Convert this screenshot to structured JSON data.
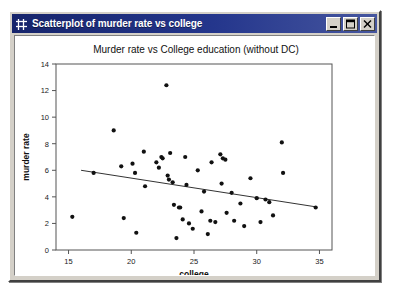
{
  "window": {
    "title": "Scatterplot of murder rate vs college",
    "icon": "plot-grid-icon",
    "buttons": {
      "minimize": "minimize-icon",
      "maximize": "maximize-icon",
      "close": "close-icon"
    },
    "colors": {
      "titlebar_start": "#16246b",
      "titlebar_end": "#46569f",
      "chrome": "#d4d0c8",
      "client_bg": "#ffffff"
    }
  },
  "chart_data": {
    "type": "scatter",
    "title": "Murder rate vs College education (without DC)",
    "xlabel": "college",
    "ylabel": "murder rate",
    "xlim": [
      14.0,
      36.0
    ],
    "ylim": [
      0,
      14
    ],
    "xticks": [
      15,
      20,
      25,
      30,
      35
    ],
    "yticks": [
      0,
      2,
      4,
      6,
      8,
      10,
      12,
      14
    ],
    "grid": false,
    "legend": false,
    "marker_color": "#111111",
    "line_color": "#333333",
    "series": [
      {
        "name": "states",
        "points": [
          [
            15.3,
            2.5
          ],
          [
            17.0,
            5.8
          ],
          [
            18.6,
            9.0
          ],
          [
            19.2,
            6.3
          ],
          [
            19.4,
            2.4
          ],
          [
            20.1,
            6.5
          ],
          [
            20.3,
            5.8
          ],
          [
            20.4,
            1.3
          ],
          [
            21.0,
            7.4
          ],
          [
            21.1,
            4.8
          ],
          [
            22.0,
            6.6
          ],
          [
            22.2,
            6.2
          ],
          [
            22.4,
            7.0
          ],
          [
            22.5,
            6.9
          ],
          [
            22.8,
            12.4
          ],
          [
            22.9,
            5.6
          ],
          [
            23.0,
            5.3
          ],
          [
            23.1,
            7.3
          ],
          [
            23.3,
            5.1
          ],
          [
            23.4,
            3.4
          ],
          [
            23.6,
            0.9
          ],
          [
            23.8,
            3.2
          ],
          [
            23.9,
            3.2
          ],
          [
            24.1,
            2.3
          ],
          [
            24.3,
            7.0
          ],
          [
            24.4,
            4.9
          ],
          [
            24.6,
            2.0
          ],
          [
            24.9,
            1.6
          ],
          [
            25.3,
            6.0
          ],
          [
            25.6,
            2.9
          ],
          [
            25.8,
            4.4
          ],
          [
            26.1,
            1.2
          ],
          [
            26.3,
            2.2
          ],
          [
            26.4,
            6.6
          ],
          [
            26.7,
            2.1
          ],
          [
            27.1,
            7.2
          ],
          [
            27.2,
            5.0
          ],
          [
            27.3,
            6.9
          ],
          [
            27.5,
            6.8
          ],
          [
            27.6,
            2.8
          ],
          [
            28.0,
            4.3
          ],
          [
            28.2,
            2.2
          ],
          [
            28.7,
            3.5
          ],
          [
            29.0,
            1.8
          ],
          [
            29.5,
            5.4
          ],
          [
            30.0,
            3.9
          ],
          [
            30.3,
            2.1
          ],
          [
            30.7,
            3.8
          ],
          [
            31.0,
            3.6
          ],
          [
            31.3,
            2.6
          ],
          [
            32.0,
            8.1
          ],
          [
            32.1,
            5.8
          ],
          [
            34.7,
            3.2
          ]
        ]
      }
    ],
    "fit_line": {
      "name": "least-squares-fit",
      "x0": 16.0,
      "y0": 6.0,
      "x1": 34.7,
      "y1": 3.25
    }
  }
}
